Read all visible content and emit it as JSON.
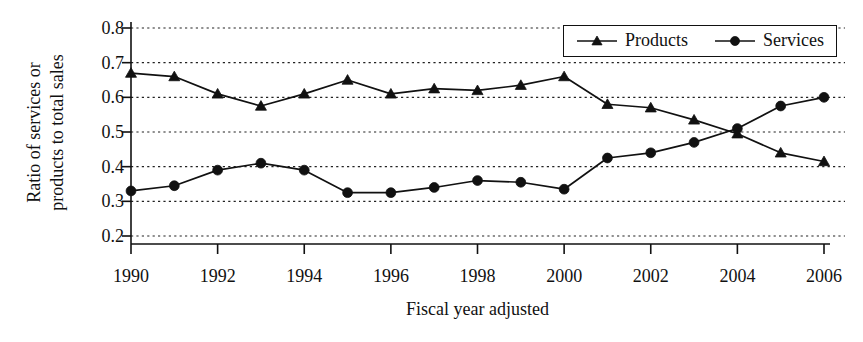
{
  "chart_data": {
    "type": "line",
    "title": "",
    "xlabel": "Fiscal year adjusted",
    "ylabel_lines": [
      "Ratio of services or",
      "products to total sales"
    ],
    "ylabel": "Ratio of services or products to total sales",
    "grid": true,
    "legend_position": "top-right",
    "xlim": [
      1990,
      2006
    ],
    "ylim": [
      0.2,
      0.8
    ],
    "yticks": [
      0.2,
      0.3,
      0.4,
      0.5,
      0.6,
      0.7,
      0.8
    ],
    "ytick_labels": [
      "0.2",
      "0.3",
      "0.4",
      "0.5",
      "0.6",
      "0.7",
      "0.8"
    ],
    "xticks": [
      1990,
      1992,
      1994,
      1996,
      1998,
      2000,
      2002,
      2004,
      2006
    ],
    "xtick_labels": [
      "1990",
      "1992",
      "1994",
      "1996",
      "1998",
      "2000",
      "2002",
      "2004",
      "2006"
    ],
    "x": [
      1990,
      1991,
      1992,
      1993,
      1994,
      1995,
      1996,
      1997,
      1998,
      1999,
      2000,
      2001,
      2002,
      2003,
      2004,
      2005,
      2006
    ],
    "series": [
      {
        "name": "Products",
        "marker": "triangle",
        "color": "#111111",
        "values": [
          0.67,
          0.66,
          0.61,
          0.575,
          0.61,
          0.65,
          0.61,
          0.625,
          0.62,
          0.635,
          0.66,
          0.58,
          0.57,
          0.535,
          0.495,
          0.44,
          0.415
        ]
      },
      {
        "name": "Services",
        "marker": "circle",
        "color": "#111111",
        "values": [
          0.33,
          0.345,
          0.39,
          0.41,
          0.39,
          0.325,
          0.325,
          0.34,
          0.36,
          0.355,
          0.335,
          0.425,
          0.44,
          0.47,
          0.51,
          0.575,
          0.6
        ]
      }
    ]
  },
  "legend": {
    "items": [
      {
        "label": "Products",
        "marker": "triangle-marker"
      },
      {
        "label": "Services",
        "marker": "circle-marker"
      }
    ]
  }
}
